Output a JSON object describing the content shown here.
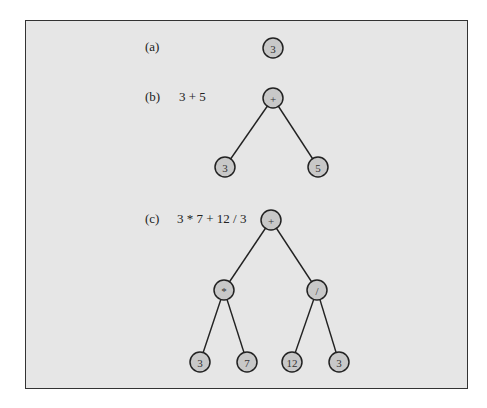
{
  "figure": {
    "panels": [
      {
        "label": "(a)",
        "expression": "",
        "nodes": [
          {
            "id": "a0",
            "value": "3",
            "x": 273,
            "y": 48
          }
        ],
        "edges": []
      },
      {
        "label": "(b)",
        "expression": "3 + 5",
        "nodes": [
          {
            "id": "b0",
            "value": "+",
            "x": 273,
            "y": 98
          },
          {
            "id": "b1",
            "value": "3",
            "x": 225,
            "y": 167
          },
          {
            "id": "b2",
            "value": "5",
            "x": 318,
            "y": 167
          }
        ],
        "edges": [
          [
            "b0",
            "b1"
          ],
          [
            "b0",
            "b2"
          ]
        ]
      },
      {
        "label": "(c)",
        "expression": "3 * 7 + 12 / 3",
        "nodes": [
          {
            "id": "c0",
            "value": "+",
            "x": 271,
            "y": 220
          },
          {
            "id": "c1",
            "value": "*",
            "x": 224,
            "y": 290
          },
          {
            "id": "c2",
            "value": "/",
            "x": 317,
            "y": 290
          },
          {
            "id": "c3",
            "value": "3",
            "x": 200,
            "y": 362
          },
          {
            "id": "c4",
            "value": "7",
            "x": 247,
            "y": 362
          },
          {
            "id": "c5",
            "value": "12",
            "x": 292,
            "y": 362
          },
          {
            "id": "c6",
            "value": "3",
            "x": 339,
            "y": 362
          }
        ],
        "edges": [
          [
            "c0",
            "c1"
          ],
          [
            "c0",
            "c2"
          ],
          [
            "c1",
            "c3"
          ],
          [
            "c1",
            "c4"
          ],
          [
            "c2",
            "c5"
          ],
          [
            "c2",
            "c6"
          ]
        ]
      }
    ],
    "label_positions": [
      {
        "x": 145,
        "y": 51
      },
      {
        "x": 145,
        "y": 101
      },
      {
        "x": 145,
        "y": 223
      }
    ],
    "expression_positions": [
      {
        "x": 0,
        "y": 0
      },
      {
        "x": 179,
        "y": 101
      },
      {
        "x": 177,
        "y": 223
      }
    ]
  }
}
